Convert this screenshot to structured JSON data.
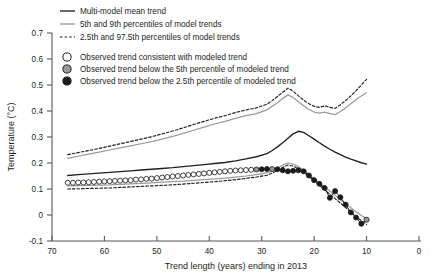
{
  "chart_data": {
    "type": "line",
    "title": "",
    "xlabel": "Trend length (years) ending in 2013",
    "ylabel": "Temperature (°C)",
    "xlim": [
      70,
      0
    ],
    "ylim": [
      -0.1,
      0.7
    ],
    "xticks": [
      70,
      60,
      50,
      40,
      30,
      20,
      10,
      0
    ],
    "yticks": [
      -0.1,
      0,
      0.1,
      0.2,
      0.3,
      0.4,
      0.5,
      0.6,
      0.7
    ],
    "x_axis_reversed": true,
    "grid": false,
    "legend_position": "top-left",
    "colors": {
      "mean_trend": "#231f20",
      "percentile_5_95": "#9a9a9a",
      "percentile_2p5_97p5": "#231f20",
      "marker_open": "#ffffff",
      "marker_grey": "#9a9a9a",
      "marker_black": "#1a1a1a",
      "axis": "#58595b"
    },
    "series": [
      {
        "name": "Multi-model mean trend",
        "style": "solid",
        "color": "#231f20",
        "x": [
          67,
          65,
          63,
          61,
          59,
          57,
          55,
          53,
          51,
          49,
          47,
          45,
          43,
          41,
          39,
          37,
          35,
          33,
          31,
          29,
          28,
          27,
          26,
          25,
          24,
          23,
          22,
          21,
          20,
          19,
          18,
          17,
          16,
          15,
          14,
          13,
          12,
          11,
          10
        ],
        "values": [
          0.152,
          0.155,
          0.158,
          0.161,
          0.164,
          0.167,
          0.17,
          0.173,
          0.176,
          0.179,
          0.182,
          0.186,
          0.19,
          0.194,
          0.198,
          0.202,
          0.208,
          0.216,
          0.224,
          0.236,
          0.248,
          0.262,
          0.278,
          0.295,
          0.312,
          0.322,
          0.318,
          0.305,
          0.292,
          0.278,
          0.265,
          0.253,
          0.242,
          0.232,
          0.223,
          0.215,
          0.208,
          0.201,
          0.196
        ]
      },
      {
        "name": "95th percentile of model trends",
        "style": "solid",
        "color": "#9a9a9a",
        "x": [
          67,
          65,
          63,
          61,
          59,
          57,
          55,
          53,
          51,
          49,
          47,
          45,
          43,
          41,
          39,
          37,
          35,
          33,
          31,
          29,
          28,
          27,
          26,
          25,
          24,
          23,
          22,
          21,
          20,
          19,
          18,
          17,
          16,
          15,
          14,
          13,
          12,
          11,
          10
        ],
        "values": [
          0.218,
          0.226,
          0.234,
          0.242,
          0.25,
          0.258,
          0.266,
          0.274,
          0.282,
          0.292,
          0.302,
          0.314,
          0.326,
          0.338,
          0.35,
          0.36,
          0.372,
          0.382,
          0.39,
          0.404,
          0.418,
          0.432,
          0.448,
          0.462,
          0.452,
          0.436,
          0.42,
          0.406,
          0.396,
          0.392,
          0.396,
          0.39,
          0.386,
          0.398,
          0.412,
          0.428,
          0.444,
          0.458,
          0.47
        ]
      },
      {
        "name": "5th percentile of model trends",
        "style": "solid",
        "color": "#9a9a9a",
        "x": [
          67,
          65,
          63,
          61,
          59,
          57,
          55,
          53,
          51,
          49,
          47,
          45,
          43,
          41,
          39,
          37,
          35,
          33,
          31,
          29,
          28,
          27,
          26,
          25,
          24,
          23,
          22,
          21,
          20,
          19,
          18,
          17,
          16,
          15,
          14,
          13,
          12,
          11,
          10
        ],
        "values": [
          0.112,
          0.113,
          0.114,
          0.115,
          0.116,
          0.118,
          0.12,
          0.122,
          0.124,
          0.126,
          0.128,
          0.13,
          0.133,
          0.136,
          0.139,
          0.142,
          0.146,
          0.15,
          0.155,
          0.162,
          0.17,
          0.18,
          0.192,
          0.2,
          0.196,
          0.186,
          0.172,
          0.156,
          0.14,
          0.124,
          0.108,
          0.092,
          0.076,
          0.06,
          0.044,
          0.028,
          0.012,
          -0.002,
          -0.014
        ]
      },
      {
        "name": "97.5th percentile of model trends",
        "style": "dashed",
        "color": "#231f20",
        "x": [
          67,
          65,
          63,
          61,
          59,
          57,
          55,
          53,
          51,
          49,
          47,
          45,
          43,
          41,
          39,
          37,
          35,
          33,
          31,
          29,
          28,
          27,
          26,
          25,
          24,
          23,
          22,
          21,
          20,
          19,
          18,
          17,
          16,
          15,
          14,
          13,
          12,
          11,
          10
        ],
        "values": [
          0.232,
          0.24,
          0.248,
          0.256,
          0.265,
          0.274,
          0.283,
          0.292,
          0.301,
          0.312,
          0.323,
          0.335,
          0.348,
          0.36,
          0.372,
          0.382,
          0.394,
          0.404,
          0.412,
          0.426,
          0.44,
          0.456,
          0.472,
          0.488,
          0.476,
          0.458,
          0.442,
          0.428,
          0.418,
          0.414,
          0.42,
          0.414,
          0.41,
          0.424,
          0.44,
          0.458,
          0.478,
          0.5,
          0.522
        ]
      },
      {
        "name": "2.5th percentile of model trends",
        "style": "dashed",
        "color": "#231f20",
        "x": [
          67,
          65,
          63,
          61,
          59,
          57,
          55,
          53,
          51,
          49,
          47,
          45,
          43,
          41,
          39,
          37,
          35,
          33,
          31,
          29,
          28,
          27,
          26,
          25,
          24,
          23,
          22,
          21,
          20,
          19,
          18,
          17,
          16,
          15,
          14,
          13,
          12,
          11,
          10
        ],
        "values": [
          0.1,
          0.101,
          0.102,
          0.103,
          0.104,
          0.106,
          0.108,
          0.11,
          0.112,
          0.114,
          0.116,
          0.119,
          0.122,
          0.125,
          0.128,
          0.132,
          0.136,
          0.141,
          0.146,
          0.153,
          0.161,
          0.171,
          0.183,
          0.192,
          0.188,
          0.178,
          0.164,
          0.148,
          0.131,
          0.114,
          0.097,
          0.08,
          0.063,
          0.046,
          0.029,
          0.012,
          -0.006,
          -0.022,
          -0.036
        ]
      },
      {
        "name": "Observed trend",
        "style": "markers-line",
        "x": [
          67,
          66,
          65,
          64,
          63,
          62,
          61,
          60,
          59,
          58,
          57,
          56,
          55,
          54,
          53,
          52,
          51,
          50,
          49,
          48,
          47,
          46,
          45,
          44,
          43,
          42,
          41,
          40,
          39,
          38,
          37,
          36,
          35,
          34,
          33,
          32,
          31,
          30,
          29,
          28,
          27,
          26,
          25,
          24,
          23,
          22,
          21,
          20,
          19,
          18,
          17,
          16,
          15,
          14,
          13,
          12,
          11,
          10
        ],
        "values": [
          0.124,
          0.124,
          0.125,
          0.125,
          0.126,
          0.127,
          0.128,
          0.129,
          0.13,
          0.131,
          0.132,
          0.133,
          0.134,
          0.136,
          0.137,
          0.139,
          0.14,
          0.142,
          0.144,
          0.146,
          0.148,
          0.15,
          0.152,
          0.154,
          0.156,
          0.158,
          0.16,
          0.162,
          0.164,
          0.166,
          0.168,
          0.17,
          0.171,
          0.172,
          0.173,
          0.174,
          0.175,
          0.176,
          0.177,
          0.177,
          0.176,
          0.172,
          0.168,
          0.17,
          0.172,
          0.168,
          0.152,
          0.134,
          0.12,
          0.104,
          0.066,
          0.092,
          0.068,
          0.04,
          0.01,
          -0.01,
          -0.034,
          -0.018
        ],
        "marker_states": [
          "open",
          "open",
          "open",
          "open",
          "open",
          "open",
          "open",
          "open",
          "open",
          "open",
          "open",
          "open",
          "open",
          "open",
          "open",
          "open",
          "open",
          "open",
          "open",
          "open",
          "open",
          "open",
          "open",
          "open",
          "open",
          "open",
          "open",
          "open",
          "open",
          "open",
          "open",
          "open",
          "open",
          "open",
          "open",
          "open",
          "grey",
          "black",
          "black",
          "grey",
          "black",
          "black",
          "black",
          "black",
          "black",
          "black",
          "black",
          "black",
          "black",
          "black",
          "black",
          "black",
          "black",
          "black",
          "black",
          "black",
          "black",
          "grey"
        ]
      }
    ],
    "legend": {
      "lines": [
        {
          "label": "Multi-model mean trend",
          "style": "solid",
          "color": "#231f20"
        },
        {
          "label": "5th and 9th percentiles of model trends",
          "style": "solid",
          "color": "#9a9a9a"
        },
        {
          "label": "2.5th and 97.5th percentiles of model trends",
          "style": "dashed",
          "color": "#231f20"
        }
      ],
      "markers": [
        {
          "label": "Observed trend consistent with modeled trend",
          "fill": "#ffffff"
        },
        {
          "label": "Observed trend below the 5th percentile of modeled trend",
          "fill": "#9a9a9a"
        },
        {
          "label": "Observed trend below the 2.5th percentile of modeled trend",
          "fill": "#1a1a1a"
        }
      ]
    }
  }
}
